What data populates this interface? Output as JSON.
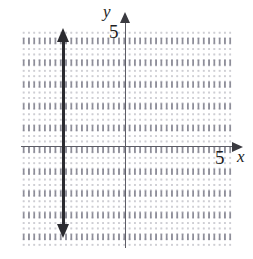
{
  "figure": {
    "kind": "coordinate-grid-graph",
    "background_color": "#ffffff"
  },
  "axes": {
    "x": {
      "label": "x",
      "tick_label": "5",
      "arrow_direction": "right",
      "color": "#5d5d66"
    },
    "y": {
      "label": "y",
      "tick_label": "5",
      "arrow_direction": "up",
      "color": "#5d5d66"
    }
  },
  "grid": {
    "minor_dot_color": "#c9c9cf",
    "major_dot_color": "#8e8e99",
    "minor_per_unit": 4
  },
  "chart_data": {
    "type": "line",
    "title": "",
    "xlabel": "x",
    "ylabel": "y",
    "xlim": [
      -5,
      5
    ],
    "ylim": [
      -5,
      5
    ],
    "xticks": [
      5
    ],
    "yticks": [
      5
    ],
    "grid": true,
    "legend": "none",
    "series": [
      {
        "name": "vertical line",
        "equation": "x = -3",
        "color": "#2b2b30",
        "arrows": "both",
        "x": [
          -3,
          -3
        ],
        "y": [
          -5,
          5
        ]
      }
    ],
    "annotations": []
  }
}
